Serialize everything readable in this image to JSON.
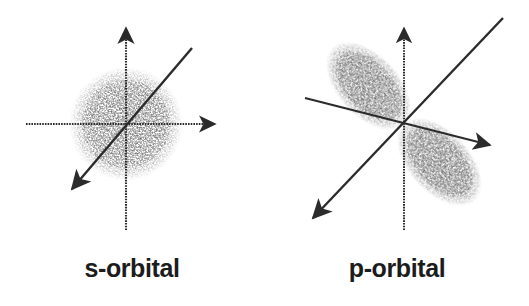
{
  "figure": {
    "background_color": "#ffffff",
    "ink_color": "#2b2b2b",
    "stipple_color": "#8c8c8c",
    "caption_color": "#1c1c1c"
  },
  "panels": [
    {
      "id": "s-orbital",
      "caption": "s-orbital",
      "orbital_type": "s",
      "origin": {
        "x": 126,
        "y": 124
      },
      "cloud": {
        "shape": "sphere",
        "radius": 55,
        "description": "spherical stippled electron cloud"
      },
      "axes": [
        {
          "name": "vertical-axis",
          "arrowhead": "up",
          "from": {
            "x": 126,
            "y": 230
          },
          "to": {
            "x": 126,
            "y": 18
          },
          "style": "dotted"
        },
        {
          "name": "horizontal-axis",
          "arrowhead": "right",
          "from": {
            "x": 26,
            "y": 124
          },
          "to": {
            "x": 225,
            "y": 124
          },
          "style": "dotted"
        },
        {
          "name": "depth-axis",
          "arrowhead": "lower-left",
          "from": {
            "x": 192,
            "y": 48
          },
          "to": {
            "x": 62,
            "y": 200
          },
          "style": "solid"
        }
      ]
    },
    {
      "id": "p-orbital",
      "caption": "p-orbital",
      "orbital_type": "p",
      "origin": {
        "x": 404,
        "y": 124
      },
      "cloud": {
        "shape": "dumbbell",
        "lobe_length": 52,
        "lobe_width": 30,
        "lobe_angle_deg": -40,
        "description": "two elongated stippled lobes along the diagonal axis"
      },
      "axes": [
        {
          "name": "vertical-axis",
          "arrowhead": "up",
          "from": {
            "x": 404,
            "y": 230
          },
          "to": {
            "x": 404,
            "y": 18
          },
          "style": "dotted"
        },
        {
          "name": "horizontal-axis",
          "arrowhead": "lower-right",
          "from": {
            "x": 305,
            "y": 98
          },
          "to": {
            "x": 500,
            "y": 148
          },
          "style": "solid"
        },
        {
          "name": "depth-axis",
          "arrowhead": "lower-left",
          "from": {
            "x": 503,
            "y": 18
          },
          "to": {
            "x": 303,
            "y": 228
          },
          "style": "solid"
        }
      ]
    }
  ]
}
